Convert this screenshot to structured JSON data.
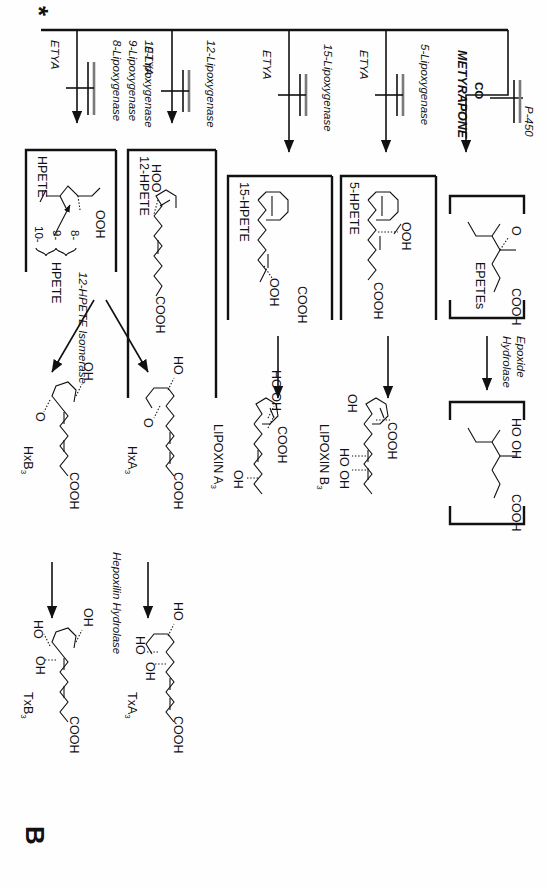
{
  "figure": {
    "panel_label": "B",
    "origin_marker": "*",
    "type": "biochemical pathway diagram",
    "orientation_note": "rotated 90 degrees"
  },
  "branches": [
    {
      "id": "p450",
      "enzymes": [
        "5-Lipoxygenase"
      ],
      "enzyme_extra": "P-450",
      "inhibitors": [
        "ETYA",
        "CO",
        "METYRAPONE"
      ],
      "product_label": "EPETEs",
      "product_sub_labels": [
        "O",
        "COOH"
      ],
      "downstream_enzyme": "Epoxide\nHydrolase",
      "downstream_labels": [
        "HO OH",
        "COOH"
      ]
    },
    {
      "id": "lox5",
      "enzyme": "5-Lipoxygenase",
      "inhibitor": "ETYA",
      "product_label": "5-HPETE",
      "product_groups": [
        "OOH",
        "COOH"
      ],
      "final_label": "LIPOXIN B",
      "final_sub": "3",
      "final_groups": [
        "OH",
        "COOH",
        "HO OH"
      ]
    },
    {
      "id": "lox15",
      "enzyme": "15-Lipoxygenase",
      "inhibitor": "ETYA",
      "product_label": "15-HPETE",
      "product_groups": [
        "COOH",
        "OOH"
      ],
      "final_label": "LIPOXIN A",
      "final_sub": "3",
      "final_groups": [
        "HO OH",
        "COOH",
        "OH"
      ]
    },
    {
      "id": "lox12",
      "enzyme": "12-Lipoxygenase",
      "inhibitor": "ETYA",
      "product_label": "12-HPETE",
      "product_groups": [
        "HOO",
        "COOH"
      ],
      "isomerase": "12-HPETE Isomerase",
      "isomer_products": [
        {
          "label": "HxA",
          "sub": "3",
          "groups": [
            "HO",
            "O",
            "COOH"
          ]
        },
        {
          "label": "HxB",
          "sub": "3",
          "groups": [
            "OH",
            "O",
            "COOH"
          ]
        }
      ],
      "hydrolase": "Hepoxilin Hydrolase",
      "hydrolase_products": [
        {
          "label": "TxA",
          "sub": "3",
          "groups": [
            "HO",
            "HO",
            "OH",
            "COOH"
          ]
        },
        {
          "label": "TxB",
          "sub": "3",
          "groups": [
            "OH",
            "HO",
            "OH",
            "COOH"
          ]
        }
      ]
    },
    {
      "id": "lox8910",
      "enzymes": [
        "8-Lipoxygenase",
        "9-Lipoxygenase",
        "10-Lipoxygenase"
      ],
      "inhibitor": "ETYA",
      "product_label": "HPETE",
      "product_prefixes": [
        "8-",
        "9-",
        "10-"
      ],
      "product_groups": [
        "OOH"
      ]
    }
  ],
  "colors": {
    "ink": "#111111",
    "inhibitor_bar": "#7a7a7a",
    "background": "#fefefe"
  }
}
